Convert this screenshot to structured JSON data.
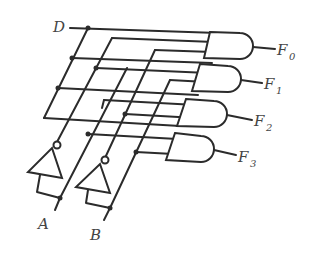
{
  "diagram": {
    "type": "logic-circuit",
    "inputs": [
      {
        "name": "D",
        "label": "D"
      },
      {
        "name": "A",
        "label": "A"
      },
      {
        "name": "B",
        "label": "B"
      }
    ],
    "outputs": [
      {
        "name": "F0",
        "label": "F",
        "subscript": "0"
      },
      {
        "name": "F1",
        "label": "F",
        "subscript": "1"
      },
      {
        "name": "F2",
        "label": "F",
        "subscript": "2"
      },
      {
        "name": "F3",
        "label": "F",
        "subscript": "3"
      }
    ],
    "gates": [
      {
        "id": "not-a",
        "type": "NOT",
        "input": "A"
      },
      {
        "id": "not-b",
        "type": "NOT",
        "input": "B"
      },
      {
        "id": "and-0",
        "type": "AND",
        "inputs": [
          "D",
          "A'",
          "B'"
        ],
        "output": "F0"
      },
      {
        "id": "and-1",
        "type": "AND",
        "inputs": [
          "D",
          "A'",
          "B"
        ],
        "output": "F1"
      },
      {
        "id": "and-2",
        "type": "AND",
        "inputs": [
          "D",
          "A",
          "B'"
        ],
        "output": "F2"
      },
      {
        "id": "and-3",
        "type": "AND",
        "inputs": [
          "D",
          "A",
          "B"
        ],
        "output": "F3"
      }
    ],
    "colors": {
      "line": "#2b2b2b",
      "text": "#444444",
      "background": "#ffffff"
    }
  }
}
